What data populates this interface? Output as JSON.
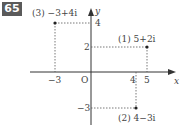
{
  "problem_number": "65",
  "axes": {
    "x_label": "x",
    "y_label": "y",
    "origin_label": "O",
    "x_ticks": [
      "-3",
      "4",
      "5"
    ],
    "y_ticks": [
      "4",
      "2",
      "-3"
    ]
  },
  "points": [
    {
      "tag": "(1)",
      "expr": "5+2i",
      "re": 5,
      "im": 2,
      "label": "(1) 5+2i"
    },
    {
      "tag": "(2)",
      "expr": "4-3i",
      "re": 4,
      "im": -3,
      "label": "(2) 4−3i"
    },
    {
      "tag": "(3)",
      "expr": "-3+4i",
      "re": -3,
      "im": 4,
      "label": "(3) −3+4i"
    }
  ],
  "tick_labels": {
    "x_neg3": "−3",
    "x_4": "4",
    "x_5": "5",
    "y_4": "4",
    "y_2": "2",
    "y_neg3": "−3"
  },
  "colors": {
    "badge_bg": "#5a5a5a",
    "line": "#333333",
    "text": "#444444"
  }
}
